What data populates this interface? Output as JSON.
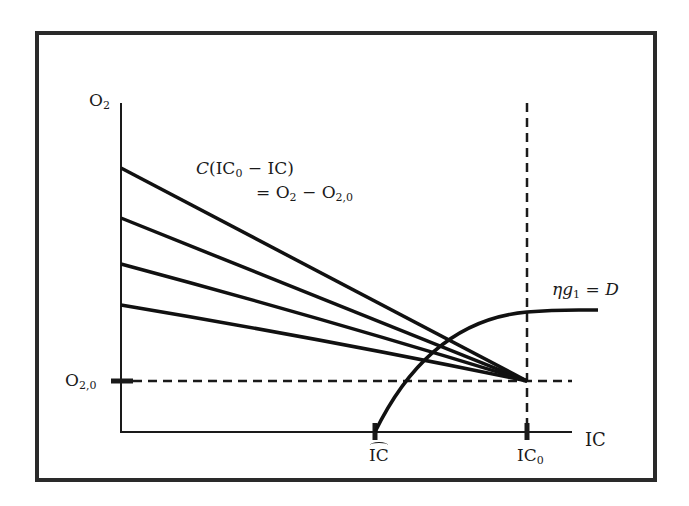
{
  "diagram": {
    "frame": {
      "left": 37,
      "top": 33,
      "right": 655,
      "bottom": 480,
      "stroke": "#2a2a2a"
    },
    "axes": {
      "origin": {
        "x": 121,
        "y": 432
      },
      "y_axis_top": 103,
      "x_axis_right": 572,
      "y_label": {
        "base": "O",
        "sub": "2"
      },
      "x_label": "IC"
    },
    "reference_lines": {
      "horizontal_dashed": {
        "y": 381,
        "label_base": "O",
        "label_sub": "2,0"
      },
      "vertical_dashed": {
        "x": 527,
        "label_base": "IC",
        "label_sub": "0"
      }
    },
    "ticks": {
      "x": [
        {
          "x": 375,
          "label": "IC",
          "hat": true
        },
        {
          "x": 527,
          "label_base": "IC",
          "label_sub": "0"
        }
      ]
    },
    "linear_family": {
      "convergence_point": {
        "x": 527,
        "y": 381
      },
      "start_points_y": [
        168,
        218,
        264,
        305
      ],
      "annotation_line1_prefix": "C",
      "annotation_line1_rest": "(IC",
      "annotation_line1_sub": "0",
      "annotation_line1_tail": " − IC)",
      "annotation_line2": "= O",
      "annotation_line2_sub1": "2",
      "annotation_line2_mid": " − O",
      "annotation_line2_sub2": "2,0"
    },
    "curve": {
      "label_eta": "η",
      "label_g": "g",
      "label_sub": "1",
      "label_eq": " = ",
      "label_D": "D",
      "start": {
        "x": 375,
        "y": 432
      },
      "end": {
        "x": 598,
        "y": 310
      }
    }
  }
}
